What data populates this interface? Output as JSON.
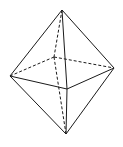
{
  "diagram": {
    "type": "octahedron",
    "stroke_color": "#1a1a1a",
    "background": "#ffffff",
    "vertices": {
      "top": [
        62,
        10
      ],
      "bottom": [
        66,
        134
      ],
      "left": [
        10,
        76
      ],
      "right": [
        114,
        68
      ],
      "front": [
        67,
        89
      ],
      "back": [
        54,
        57
      ]
    },
    "solid_edges": [
      [
        "top",
        "left"
      ],
      [
        "top",
        "right"
      ],
      [
        "top",
        "front"
      ],
      [
        "bottom",
        "left"
      ],
      [
        "bottom",
        "right"
      ],
      [
        "bottom",
        "front"
      ],
      [
        "left",
        "front"
      ],
      [
        "front",
        "right"
      ]
    ],
    "dashed_edges": [
      [
        "top",
        "back"
      ],
      [
        "bottom",
        "back"
      ],
      [
        "left",
        "back"
      ],
      [
        "back",
        "right"
      ]
    ]
  }
}
